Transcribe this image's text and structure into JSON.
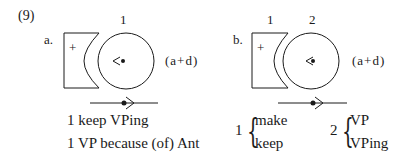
{
  "example_number": "(9)",
  "panel_a": {
    "label": "a.",
    "index_labels": [
      "1"
    ],
    "plus_sign": "+",
    "annotation": "(a+d)",
    "lines": [
      "1 keep VPing",
      "1 VP because (of) Ant"
    ]
  },
  "panel_b": {
    "label": "b.",
    "index_labels": [
      "1",
      "2"
    ],
    "plus_sign": "+",
    "annotation": "(a+d)",
    "group1": {
      "index": "1",
      "options": [
        "make",
        "keep"
      ]
    },
    "group2": {
      "index": "2",
      "options": [
        "VP",
        "VPing"
      ]
    }
  }
}
